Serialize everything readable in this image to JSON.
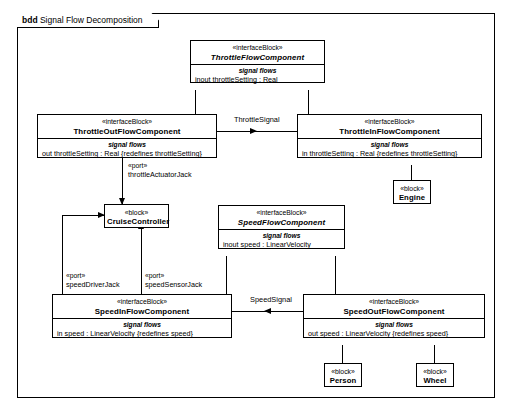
{
  "diagram": {
    "kind": "bdd",
    "title": "Signal Flow Decomposition",
    "stereotype_interface": "«interfaceBlock»",
    "stereotype_block": "«block»",
    "stereotype_port": "«port»",
    "compartment_label": "signal flows"
  },
  "blocks": {
    "throttle_flow": {
      "stereotype": "«interfaceBlock»",
      "name": "ThrottleFlowComponent",
      "compartment_label": "signal flows",
      "features": [
        "inout throttleSetting : Real"
      ]
    },
    "throttle_out_flow": {
      "stereotype": "«interfaceBlock»",
      "name": "ThrottleOutFlowComponent",
      "compartment_label": "signal flows",
      "features": [
        "out throttleSetting : Real {redefines throttleSetting}"
      ]
    },
    "throttle_in_flow": {
      "stereotype": "«interfaceBlock»",
      "name": "ThrottleInFlowComponent",
      "compartment_label": "signal flows",
      "features": [
        "in throttleSetting : Real {redefines throttleSetting}"
      ]
    },
    "engine": {
      "stereotype": "«block»",
      "name": "Engine"
    },
    "cruise_controller": {
      "stereotype": "«block»",
      "name": "CruiseController"
    },
    "speed_flow": {
      "stereotype": "«interfaceBlock»",
      "name": "SpeedFlowComponent",
      "compartment_label": "signal flows",
      "features": [
        "inout speed : LinearVelocity"
      ]
    },
    "speed_in_flow": {
      "stereotype": "«interfaceBlock»",
      "name": "SpeedInFlowComponent",
      "compartment_label": "signal flows",
      "features": [
        "in speed : LinearVelocity {redefines speed}"
      ]
    },
    "speed_out_flow": {
      "stereotype": "«interfaceBlock»",
      "name": "SpeedOutFlowComponent",
      "compartment_label": "signal flows",
      "features": [
        "out speed : LinearVelocity {redefines speed}"
      ]
    },
    "person": {
      "stereotype": "«block»",
      "name": "Person"
    },
    "wheel": {
      "stereotype": "«block»",
      "name": "Wheel"
    }
  },
  "edges": {
    "throttle_signal": {
      "label": "ThrottleSignal"
    },
    "speed_signal": {
      "label": "SpeedSignal"
    }
  },
  "ports": {
    "throttle_actuator_jack": {
      "stereotype": "«port»",
      "name": "throttleActuatorJack"
    },
    "speed_driver_jack": {
      "stereotype": "«port»",
      "name": "speedDriverJack"
    },
    "speed_sensor_jack": {
      "stereotype": "«port»",
      "name": "speedSensorJack"
    }
  },
  "colors": {
    "line": "#000000",
    "background": "#ffffff"
  }
}
